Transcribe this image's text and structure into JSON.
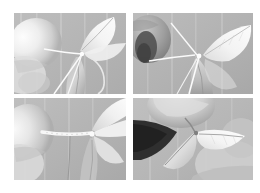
{
  "figure": {
    "title": "Plant grafting and propagation photo sequence",
    "layout": "2x2 grid",
    "background_color": "#ffffff",
    "panel_count": 4,
    "rendering": "grayscale photographs"
  },
  "panels": [
    {
      "id": "panel-top-left",
      "position": "top-left",
      "label": "a",
      "caption": "Hand holding plant stem with leaves and white binding thread",
      "subject": "plant-stem-with-leaves",
      "background_color": "#b5b5b5",
      "tones": {
        "backdrop": "#b6b6b6",
        "hand": "#ededed",
        "leaf_light": "#f2f2f2",
        "leaf_mid": "#c9c9c9",
        "leaf_shadow": "#a8a8a8",
        "thread": "#fbfbfb",
        "stem": "#d8d8d8"
      },
      "elements": [
        "finger",
        "thumb",
        "upper-leaf",
        "lower-leaf",
        "graft-union",
        "white-thread"
      ]
    },
    {
      "id": "panel-top-right",
      "position": "top-right",
      "label": "b",
      "caption": "Close view of graft junction with crossed white threads and thumb at left",
      "subject": "graft-junction-detail",
      "background_color": "#b0b0b0",
      "tones": {
        "backdrop": "#b2b2b2",
        "hand": "#8d8d8d",
        "dark_shadow": "#4a4a4a",
        "leaf_light": "#f4f4f4",
        "leaf_mid": "#cfcfcf",
        "leaf_shadow": "#9a9a9a",
        "thread": "#fcfcfc"
      },
      "elements": [
        "thumb",
        "dark-nail-shadow",
        "upper-leaf",
        "lower-leaf",
        "vertical-thread",
        "diagonal-thread",
        "graft-node"
      ]
    },
    {
      "id": "panel-bottom-left",
      "position": "bottom-left",
      "label": "c",
      "caption": "Wrapped and bound graft union held between fingers",
      "subject": "bound-graft-union",
      "background_color": "#b4b4b4",
      "tones": {
        "backdrop": "#b5b5b5",
        "hand": "#e4e4e4",
        "leaf_light": "#f3f3f3",
        "leaf_mid": "#cbcbcb",
        "leaf_shadow": "#a5a5a5",
        "wrap": "#f8f8f8",
        "stem": "#9e9e9e"
      },
      "elements": [
        "finger",
        "thumb",
        "wrapped-binding",
        "leaf-fan",
        "descending-stem"
      ]
    },
    {
      "id": "panel-bottom-right",
      "position": "bottom-right",
      "label": "d",
      "caption": "Fingers holding a small two-leaf cutting against a dark background",
      "subject": "two-leaf-cutting",
      "background_color": "#b7b7b7",
      "tones": {
        "backdrop": "#b8b8b8",
        "hand": "#d6d6d6",
        "dark_region": "#2e2e2e",
        "leaf_light": "#f5f5f5",
        "leaf_mid": "#d2d2d2",
        "leaf_shadow": "#a9a9a9",
        "midrib": "#8f8f8f"
      },
      "elements": [
        "upper-finger",
        "lower-finger",
        "dark-background",
        "left-leaf",
        "right-leaf",
        "leaf-midrib",
        "petiole"
      ]
    }
  ]
}
